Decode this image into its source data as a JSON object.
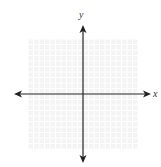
{
  "chart_data": {
    "type": "scatter",
    "title": "",
    "xlabel": "x",
    "ylabel": "y",
    "grid": true,
    "grid_cells": {
      "x": 20,
      "y": 20
    },
    "xlim": [
      -10,
      10
    ],
    "ylim": [
      -10,
      10
    ],
    "series": [],
    "axes_arrows": true,
    "colors": {
      "grid": "#e6e6e6",
      "grid_bg": "#f4f4f4",
      "axis": "#222222"
    }
  },
  "labels": {
    "x": "x",
    "y": "y"
  }
}
